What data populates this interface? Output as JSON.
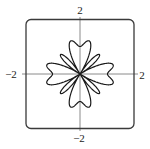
{
  "chart_data": {
    "type": "line",
    "subtype": "polar",
    "title": "",
    "equation": "r = sin^2(4θ) + cos(4θ)",
    "theta_range": [
      0,
      6.283185307
    ],
    "samples": 720,
    "xlabel": "",
    "ylabel": "",
    "xlim": [
      -2,
      2
    ],
    "ylim": [
      -2,
      2
    ],
    "grid": false,
    "legend": null,
    "tick_labels": {
      "top": "2",
      "bottom": "−2",
      "left": "−2",
      "right": "2"
    },
    "features": {
      "large_lobes": 4,
      "large_lobe_directions_deg": [
        0,
        90,
        180,
        270
      ],
      "large_lobe_max_r": 1.25,
      "r_on_axes": 1.0,
      "thin_petals": 4,
      "thin_petal_directions_deg": [
        45,
        135,
        225,
        315
      ],
      "thin_petal_length": 1.0
    },
    "window": {
      "frame": "rounded-square",
      "axes_visible": true
    }
  },
  "colors": {
    "curve": "#1a1a1a",
    "frame": "#3a3a3a",
    "axes": "#8a8a8a",
    "background": "#ffffff"
  }
}
